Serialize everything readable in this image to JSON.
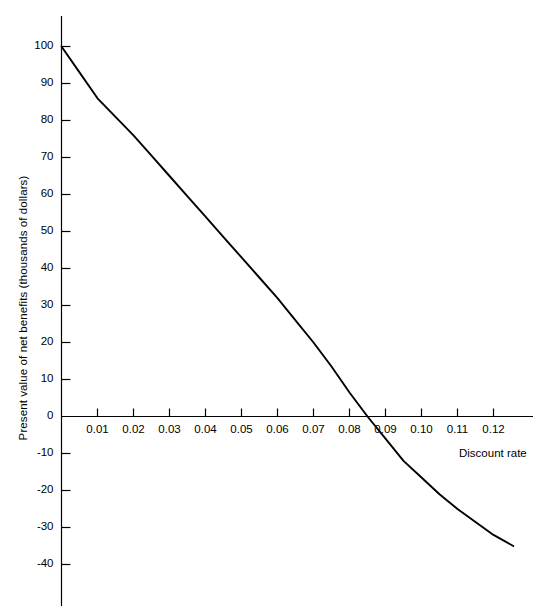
{
  "chart_data": {
    "type": "line",
    "title": "",
    "subtitle": "",
    "xlabel": "Discount rate",
    "ylabel": "Present value of net benefits (thousands of dollars)",
    "xlim": [
      0.0,
      0.1275
    ],
    "ylim": [
      -45,
      104
    ],
    "xticks": [
      0.01,
      0.02,
      0.03,
      0.04,
      0.05,
      0.06,
      0.07,
      0.08,
      0.09,
      0.1,
      0.11,
      0.12
    ],
    "xtick_labels": [
      "0.01",
      "0.02",
      "0.03",
      "0.04",
      "0.05",
      "0.06",
      "0.07",
      "0.08",
      "0.09",
      "0.10",
      "0.11",
      "0.12"
    ],
    "yticks": [
      100,
      90,
      80,
      70,
      60,
      50,
      40,
      30,
      20,
      10,
      0,
      -10,
      -20,
      -30,
      -40
    ],
    "ytick_labels": [
      "100",
      "90",
      "80",
      "70",
      "60",
      "50",
      "40",
      "30",
      "20",
      "10",
      "0",
      "-10",
      "-20",
      "-30",
      "-40"
    ],
    "grid": false,
    "legend": null,
    "legend_position": "none",
    "line_color": "#000000",
    "axis_color": "#000000",
    "background_color": "#ffffff",
    "zero_crossing_x": 0.085,
    "series": [
      {
        "name": "Present value of net benefits",
        "x": [
          0.0,
          0.005,
          0.01,
          0.015,
          0.02,
          0.025,
          0.03,
          0.035,
          0.04,
          0.045,
          0.05,
          0.055,
          0.06,
          0.065,
          0.07,
          0.075,
          0.08,
          0.085,
          0.09,
          0.095,
          0.1,
          0.105,
          0.11,
          0.115,
          0.12,
          0.1255
        ],
        "values": [
          100.0,
          93.0,
          86.0,
          81.0,
          76.0,
          70.5,
          65.0,
          59.5,
          54.0,
          48.5,
          43.0,
          37.5,
          32.0,
          26.0,
          20.0,
          13.5,
          6.5,
          0.0,
          -6.0,
          -12.0,
          -16.5,
          -21.0,
          -25.0,
          -28.5,
          -32.0,
          -35.0
        ]
      }
    ]
  }
}
